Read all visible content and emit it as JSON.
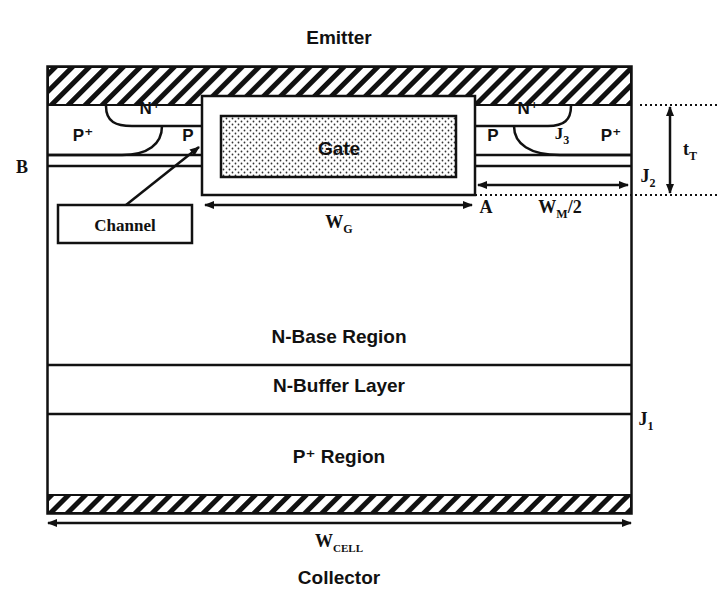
{
  "diagram": {
    "terminals": {
      "top": "Emitter",
      "bottom": "Collector"
    },
    "regions": {
      "n_plus_left": "N⁺",
      "n_plus_right": "N⁺",
      "p_plus_left": "P⁺",
      "p_plus_right": "P⁺",
      "p_left": "P",
      "p_right": "P",
      "gate": "Gate",
      "n_base": "N-Base Region",
      "n_buffer": "N-Buffer Layer",
      "p_plus_region": "P⁺ Region"
    },
    "callouts": {
      "channel": "Channel"
    },
    "markers": {
      "b": "B",
      "a": "A",
      "j1": "J",
      "j1_sub": "1",
      "j2": "J",
      "j2_sub": "2",
      "j3": "J",
      "j3_sub": "3",
      "tt": "t",
      "tt_sub": "T"
    },
    "dimensions": {
      "wg": "W",
      "wg_sub": "G",
      "wm": "W",
      "wm_sub": "M",
      "wm_suffix": "/2",
      "wcell": "W",
      "wcell_sub": "CELL"
    },
    "colors": {
      "line": "#111111",
      "background": "#ffffff"
    }
  }
}
